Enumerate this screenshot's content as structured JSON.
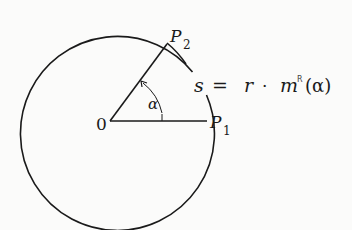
{
  "diagram": {
    "type": "circle-arc-length",
    "center": {
      "x": 110,
      "y": 121,
      "label": "0"
    },
    "radius": 97,
    "points": [
      {
        "id": "P1",
        "label": "P",
        "subscript": "1",
        "x": 207,
        "y": 121
      },
      {
        "id": "P2",
        "label": "P",
        "subscript": "2",
        "x": 167,
        "y": 43
      }
    ],
    "angle": {
      "label": "α",
      "from": "P1",
      "to": "P2"
    },
    "formula": {
      "lhs": "s",
      "eq": "=",
      "r": "r",
      "dot": "·",
      "m": "m",
      "superscript": "R",
      "arg": "(α)"
    },
    "colors": {
      "stroke": "#1a1a1a",
      "background": "#fbfbfa"
    }
  }
}
